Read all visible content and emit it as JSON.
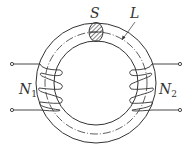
{
  "diagram": {
    "type": "toroid-transformer",
    "labels": {
      "cross_section": "S",
      "mean_path": "L",
      "coil1_main": "N",
      "coil1_sub": "1",
      "coil2_main": "N",
      "coil2_sub": "2"
    },
    "colors": {
      "stroke": "#333333",
      "background": "#ffffff"
    }
  }
}
